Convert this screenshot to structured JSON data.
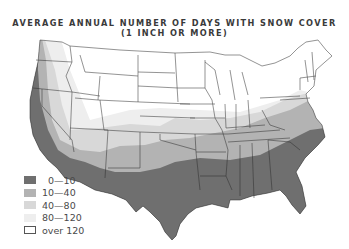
{
  "title": {
    "line1": "AVERAGE ANNUAL NUMBER OF DAYS WITH SNOW COVER",
    "line2": "(1 INCH OR MORE)"
  },
  "map": {
    "region": "Contiguous United States",
    "variable": "Average annual number of days with snow cover of 1 inch or more"
  },
  "legend": {
    "items": [
      {
        "label": "0—10",
        "color": "#6f6f6f"
      },
      {
        "label": "10—40",
        "color": "#b3b3b3"
      },
      {
        "label": "40—80",
        "color": "#d8d8d8"
      },
      {
        "label": "80—120",
        "color": "#eeeeee"
      },
      {
        "label": "over 120",
        "color": "#ffffff"
      }
    ]
  }
}
